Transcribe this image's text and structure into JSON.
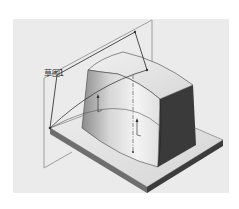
{
  "viewport": {
    "background": "#ebebeb",
    "model": {
      "name": "extruded-block-on-base-plate",
      "sketch_label": "草图1",
      "colors": {
        "plate_top": "#e6e6e6",
        "plate_side_front": "#6e6e6e",
        "plate_side_right": "#3c3c3c",
        "block_front_light": "#f2f2f2",
        "block_front_shade": "#9a9a9a",
        "block_top": "#e2e2e2",
        "block_right_dark": "#3a3a3a",
        "sketch_line": "#3a3a3a",
        "plane_line": "#8a8a8a"
      }
    }
  }
}
